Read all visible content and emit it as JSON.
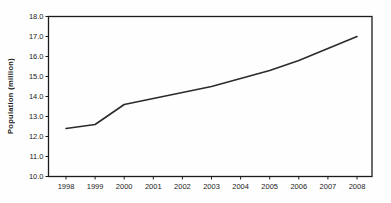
{
  "chart_data": {
    "type": "line",
    "categories": [
      "1998",
      "1999",
      "2000",
      "2001",
      "2002",
      "2003",
      "2004",
      "2005",
      "2006",
      "2007",
      "2008"
    ],
    "values": [
      12.4,
      12.6,
      13.6,
      13.9,
      14.2,
      14.5,
      14.9,
      15.3,
      15.8,
      16.4,
      17.0
    ],
    "title": "",
    "xlabel": "",
    "ylabel": "Population (million)",
    "ylim": [
      10.0,
      18.0
    ],
    "ytick_interval": 1.0,
    "ytick_labels": [
      "10.0",
      "11.0",
      "12.0",
      "13.0",
      "14.0",
      "15.0",
      "16.0",
      "17.0",
      "18.0"
    ],
    "grid": false,
    "legend": "none",
    "colors": {
      "line": "#2b2b2b",
      "axis": "#1c1c1c",
      "text": "#1c1c1c",
      "background": "#fefefe"
    }
  }
}
